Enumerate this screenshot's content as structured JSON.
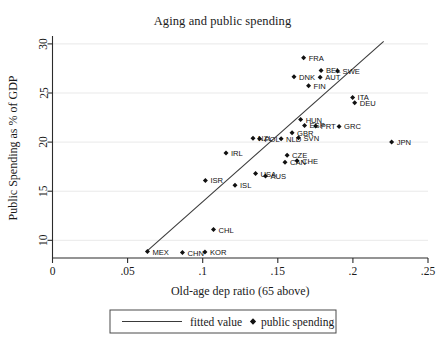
{
  "chart_data": {
    "type": "scatter",
    "title": "Aging and public spending",
    "xlabel": "Old-age dep ratio (65 above)",
    "ylabel": "Public Spending as % of GDP",
    "xlim": [
      0,
      0.25
    ],
    "ylim": [
      8.2,
      30.6
    ],
    "xticks": [
      0,
      0.05,
      0.1,
      0.15,
      0.2,
      0.25
    ],
    "xtick_labels": [
      "0",
      ".05",
      ".1",
      ".15",
      ".2",
      ".25"
    ],
    "yticks": [
      10,
      15,
      20,
      25,
      30
    ],
    "ytick_labels": [
      "10",
      "15",
      "20",
      "25",
      "30"
    ],
    "grid": "horizontal",
    "legend_position": "below-axis-center",
    "legend": [
      {
        "label": "fitted value",
        "marker": "line"
      },
      {
        "label": "public spending",
        "marker": "diamond"
      }
    ],
    "fitted_line": {
      "label": "fitted value",
      "x": [
        0.0625,
        0.2205
      ],
      "y": [
        8.85,
        30.25
      ]
    },
    "series": [
      {
        "name": "public spending",
        "marker": "diamond",
        "points": [
          {
            "label": "FRA",
            "x": 0.1672,
            "y": 28.6,
            "lx": 5,
            "ly": 3
          },
          {
            "label": "BEL",
            "x": 0.1788,
            "y": 27.3,
            "lx": 5,
            "ly": 3
          },
          {
            "label": "SWE",
            "x": 0.1898,
            "y": 27.25,
            "lx": 5,
            "ly": 3
          },
          {
            "label": "DNK",
            "x": 0.1608,
            "y": 26.65,
            "lx": 5,
            "ly": 3
          },
          {
            "label": "AUT",
            "x": 0.1782,
            "y": 26.6,
            "lx": 5,
            "ly": 3
          },
          {
            "label": "FIN",
            "x": 0.1705,
            "y": 25.75,
            "lx": 5,
            "ly": 3
          },
          {
            "label": "ITA",
            "x": 0.1998,
            "y": 24.55,
            "lx": 5,
            "ly": 3
          },
          {
            "label": "DEU",
            "x": 0.2012,
            "y": 24.0,
            "lx": 5,
            "ly": 3
          },
          {
            "label": "HUN",
            "x": 0.1652,
            "y": 22.3,
            "lx": 5,
            "ly": 3
          },
          {
            "label": "ESP",
            "x": 0.1678,
            "y": 21.7,
            "lx": 5,
            "ly": 3
          },
          {
            "label": "PRT",
            "x": 0.1752,
            "y": 21.65,
            "lx": 5,
            "ly": 3
          },
          {
            "label": "GRC",
            "x": 0.1908,
            "y": 21.6,
            "lx": 5,
            "ly": 3
          },
          {
            "label": "GBR",
            "x": 0.1595,
            "y": 20.95,
            "lx": 5,
            "ly": 3
          },
          {
            "label": "SVN",
            "x": 0.1638,
            "y": 20.45,
            "lx": 5,
            "ly": 3
          },
          {
            "label": "NZL",
            "x": 0.1335,
            "y": 20.4,
            "lx": 5,
            "ly": 3
          },
          {
            "label": "POL",
            "x": 0.1378,
            "y": 20.35,
            "lx": 5,
            "ly": 3
          },
          {
            "label": "NLD",
            "x": 0.1522,
            "y": 20.35,
            "lx": 5,
            "ly": 3
          },
          {
            "label": "JPN",
            "x": 0.2258,
            "y": 20.0,
            "lx": 5,
            "ly": 3
          },
          {
            "label": "IRL",
            "x": 0.1155,
            "y": 18.9,
            "lx": 5,
            "ly": 3
          },
          {
            "label": "CZE",
            "x": 0.1562,
            "y": 18.65,
            "lx": 5,
            "ly": 3
          },
          {
            "label": "CHE",
            "x": 0.1628,
            "y": 18.1,
            "lx": 5,
            "ly": 3
          },
          {
            "label": "CAN",
            "x": 0.1548,
            "y": 17.95,
            "lx": 5,
            "ly": 3
          },
          {
            "label": "ISR",
            "x": 0.1018,
            "y": 16.1,
            "lx": 5,
            "ly": 3
          },
          {
            "label": "USA",
            "x": 0.1352,
            "y": 16.8,
            "lx": 5,
            "ly": 3
          },
          {
            "label": "AUS",
            "x": 0.1418,
            "y": 16.55,
            "lx": 5,
            "ly": 3
          },
          {
            "label": "ISL",
            "x": 0.1215,
            "y": 15.6,
            "lx": 5,
            "ly": 3
          },
          {
            "label": "CHL",
            "x": 0.1072,
            "y": 11.1,
            "lx": 5,
            "ly": 3
          },
          {
            "label": "MEX",
            "x": 0.0632,
            "y": 8.85,
            "lx": 5,
            "ly": 3
          },
          {
            "label": "CHN",
            "x": 0.0865,
            "y": 8.75,
            "lx": 5,
            "ly": 3
          },
          {
            "label": "KOR",
            "x": 0.1015,
            "y": 8.8,
            "lx": 5,
            "ly": 3
          }
        ]
      }
    ]
  }
}
